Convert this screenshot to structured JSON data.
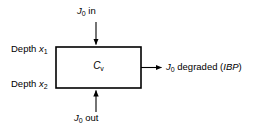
{
  "diagram": {
    "background_color": "#ffffff",
    "line_color": "#000000",
    "box": {
      "symbol_main": "C",
      "symbol_sub": "v",
      "name": "compartment-box"
    },
    "arrows": {
      "inflow": {
        "label_main": "J",
        "label_sub": "0",
        "label_rest": " in",
        "direction": "down"
      },
      "outflow": {
        "label_main": "J",
        "label_sub": "0",
        "label_rest": " out",
        "direction": "up"
      },
      "degraded": {
        "label_main": "J",
        "label_sub": "0",
        "label_rest": " degraded (",
        "label_italic": "IBP",
        "label_close": ")",
        "direction": "right"
      }
    },
    "depth_labels": [
      {
        "text": "Depth ",
        "symbol": "x",
        "sub": "1",
        "name": "depth-upper"
      },
      {
        "text": "Depth ",
        "symbol": "x",
        "sub": "2",
        "name": "depth-lower"
      }
    ]
  }
}
